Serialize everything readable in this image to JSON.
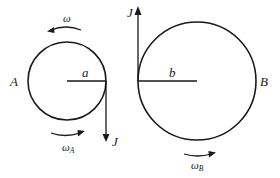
{
  "diagram": {
    "disk_a": {
      "label": "A",
      "radius_label": "a",
      "impulse_label": "J",
      "impulse_direction": "down",
      "angular_velocity_initial_label": "ω",
      "angular_velocity_initial_direction": "counterclockwise",
      "angular_velocity_final_label": "ω",
      "angular_velocity_final_subscript": "A",
      "angular_velocity_final_direction": "clockwise"
    },
    "disk_b": {
      "label": "B",
      "radius_label": "b",
      "impulse_label": "J",
      "impulse_direction": "up",
      "angular_velocity_final_label": "ω",
      "angular_velocity_final_subscript": "B",
      "angular_velocity_final_direction": "clockwise"
    },
    "colors": {
      "ink": "#1a1a1a",
      "background": "#ffffff"
    }
  }
}
